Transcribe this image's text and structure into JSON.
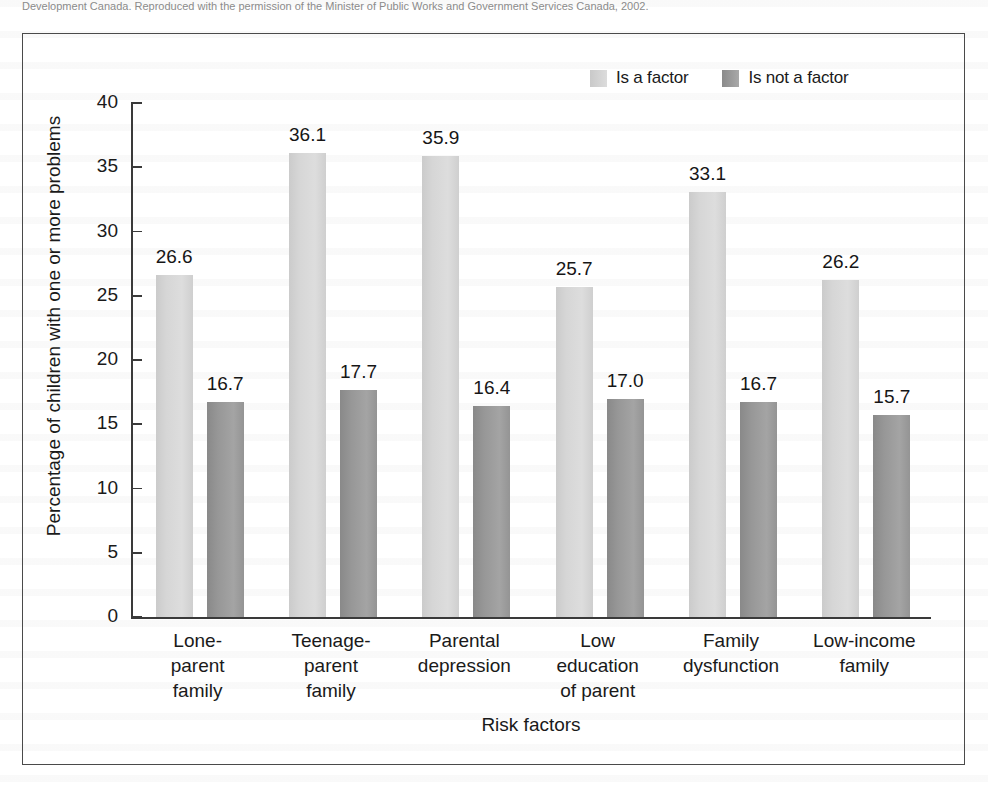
{
  "caption_strip": {
    "text": "Development Canada. Reproduced with the permission of the Minister of Public Works and Government Services Canada, 2002."
  },
  "legend": {
    "position": "top-right",
    "entries": [
      {
        "label": "Is a factor",
        "swatch": "light-gray-swatch-icon",
        "color": "#d6d6d6"
      },
      {
        "label": "Is not a factor",
        "swatch": "dark-gray-swatch-icon",
        "color": "#979797"
      }
    ]
  },
  "chart_data": {
    "type": "bar",
    "title": "",
    "xlabel": "Risk factors",
    "ylabel": "Percentage of children with one or more problems",
    "ylim": [
      0,
      40
    ],
    "yticks": [
      0,
      5,
      10,
      15,
      20,
      25,
      30,
      35,
      40
    ],
    "grid": false,
    "legend_position": "top-right",
    "categories": [
      "Lone-\nparent\nfamily",
      "Teenage-\nparent\nfamily",
      "Parental\ndepression",
      "Low\neducation\nof parent",
      "Family\ndysfunction",
      "Low-income\nfamily"
    ],
    "series": [
      {
        "name": "Is a factor",
        "color": "#d6d6d6",
        "values": [
          26.6,
          36.1,
          35.9,
          25.7,
          33.1,
          26.2
        ]
      },
      {
        "name": "Is not a factor",
        "color": "#979797",
        "values": [
          16.7,
          17.7,
          16.4,
          17.0,
          16.7,
          15.7
        ]
      }
    ],
    "value_labels": {
      "is_a_factor": [
        "26.6",
        "36.1",
        "35.9",
        "25.7",
        "33.1",
        "26.2"
      ],
      "is_not_a_factor": [
        "16.7",
        "17.7",
        "16.4",
        "17.0",
        "16.7",
        "15.7"
      ]
    }
  }
}
